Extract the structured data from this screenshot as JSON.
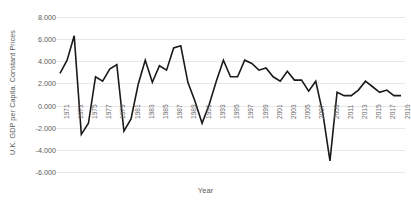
{
  "chart_data": {
    "type": "line",
    "title": "",
    "xlabel": "Year",
    "ylabel": "U.K. GDP per Capita, Constant Prices",
    "ylim": [
      -6.0,
      8.0
    ],
    "ytick_step": 2.0,
    "ytick_labels": [
      "8.000",
      "6.000",
      "4.000",
      "2.000",
      "0.000",
      "-2.000",
      "-4.000",
      "-6.000"
    ],
    "ytick_values": [
      8.0,
      6.0,
      4.0,
      2.0,
      0.0,
      -2.0,
      -4.0,
      -6.0
    ],
    "xtick_labels": [
      "1971",
      "1973",
      "1975",
      "1977",
      "1979",
      "1981",
      "1983",
      "1985",
      "1987",
      "1989",
      "1991",
      "1993",
      "1995",
      "1997",
      "1999",
      "2001",
      "2003",
      "2005",
      "2007",
      "2009",
      "2011",
      "2013",
      "2015",
      "2017",
      "2019"
    ],
    "xtick_values": [
      1971,
      1973,
      1975,
      1977,
      1979,
      1981,
      1983,
      1985,
      1987,
      1989,
      1991,
      1993,
      1995,
      1997,
      1999,
      2001,
      2003,
      2005,
      2007,
      2009,
      2011,
      2013,
      2015,
      2017,
      2019
    ],
    "grid": true,
    "grid_axis": "y",
    "legend": false,
    "line_color": "#1a1a1a",
    "line_width": 1.6,
    "x": [
      1971,
      1972,
      1973,
      1974,
      1975,
      1976,
      1977,
      1978,
      1979,
      1980,
      1981,
      1982,
      1983,
      1984,
      1985,
      1986,
      1987,
      1988,
      1989,
      1990,
      1991,
      1992,
      1993,
      1994,
      1995,
      1996,
      1997,
      1998,
      1999,
      2000,
      2001,
      2002,
      2003,
      2004,
      2005,
      2006,
      2007,
      2008,
      2009,
      2010,
      2011,
      2012,
      2013,
      2014,
      2015,
      2016,
      2017,
      2018,
      2019
    ],
    "values": [
      2.9,
      4.1,
      6.3,
      -2.6,
      -1.6,
      2.6,
      2.2,
      3.3,
      3.7,
      -2.3,
      -1.2,
      1.9,
      4.1,
      2.1,
      3.6,
      3.2,
      5.2,
      5.4,
      2.1,
      0.4,
      -1.6,
      0.1,
      2.2,
      4.1,
      2.6,
      2.6,
      4.1,
      3.8,
      3.2,
      3.4,
      2.6,
      2.2,
      3.1,
      2.3,
      2.3,
      1.3,
      2.2,
      -0.7,
      -5.0,
      1.2,
      0.9,
      0.9,
      1.4,
      2.2,
      1.7,
      1.2,
      1.4,
      0.9,
      0.9
    ]
  },
  "axes": {
    "y_title": "U.K. GDP per Capita, Constant Prices",
    "x_title": "Year"
  }
}
